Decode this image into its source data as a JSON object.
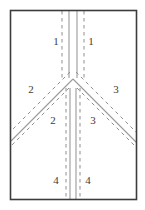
{
  "diagram": {
    "type": "lane-junction-schematic",
    "canvas": {
      "width": 145,
      "height": 210,
      "background": "#ffffff"
    },
    "frame": {
      "name": "outer-border",
      "x": 10.5,
      "y": 10.5,
      "width": 126,
      "height": 189,
      "stroke": "#3c3c3c",
      "stroke_width": 1.6,
      "fill": "none"
    },
    "colors": {
      "frame": "#3c3c3c",
      "solid_lane_line": "#9a9a9a",
      "dashed_lane_line": "#8f8f8f",
      "label_text": "#3b3b3b",
      "background": "#ffffff"
    },
    "geometry": {
      "apex_x": 73,
      "apex_y": 78,
      "top_y": 11,
      "bottom_y": 199,
      "left_x": 11,
      "right_x": 136,
      "center_left_x": 69,
      "center_right_x": 77,
      "dash_pattern": "3.5 3.5",
      "solid_width": 1.1,
      "dashed_width": 1.0
    },
    "lanes": [
      {
        "id": "north-left-solid",
        "kind": "solid",
        "role": "center-divider-left",
        "points": "69,11 69,78"
      },
      {
        "id": "north-right-solid",
        "kind": "solid",
        "role": "center-divider-right",
        "points": "77,11 77,78"
      },
      {
        "id": "north-left-dashed",
        "kind": "dashed",
        "role": "lane-edge",
        "points": "62,11 62,78"
      },
      {
        "id": "north-right-dashed",
        "kind": "dashed",
        "role": "lane-edge",
        "points": "84,11 84,78"
      },
      {
        "id": "branch-left-solid",
        "kind": "solid",
        "role": "branch-center-left",
        "points": "73,79 11,141"
      },
      {
        "id": "branch-right-solid",
        "kind": "solid",
        "role": "branch-center-right",
        "points": "73,79 136,142"
      },
      {
        "id": "branch-left-dashed-upper",
        "kind": "dashed",
        "role": "branch-edge",
        "points": "70,72 11,131"
      },
      {
        "id": "branch-left-dashed-lower",
        "kind": "dashed",
        "role": "branch-edge",
        "points": "69,88 11,146"
      },
      {
        "id": "branch-right-dashed-upper",
        "kind": "dashed",
        "role": "branch-edge",
        "points": "76,72 136,132"
      },
      {
        "id": "branch-right-dashed-lower",
        "kind": "dashed",
        "role": "branch-edge",
        "points": "77,88 136,147"
      },
      {
        "id": "south-left-solid",
        "kind": "solid",
        "role": "center-divider-left",
        "points": "70,88 70,199"
      },
      {
        "id": "south-right-solid",
        "kind": "solid",
        "role": "center-divider-right",
        "points": "76,88 76,199"
      },
      {
        "id": "south-left-dashed",
        "kind": "dashed",
        "role": "lane-edge",
        "points": "66,88 66,199"
      },
      {
        "id": "south-right-dashed",
        "kind": "dashed",
        "role": "lane-edge",
        "points": "80,88 80,199"
      }
    ],
    "labels": [
      {
        "id": "label-1-left",
        "text": "1",
        "x": 56,
        "y": 42
      },
      {
        "id": "label-1-right",
        "text": "1",
        "x": 91,
        "y": 42
      },
      {
        "id": "label-2-upper",
        "text": "2",
        "x": 31,
        "y": 90
      },
      {
        "id": "label-3-upper",
        "text": "3",
        "x": 116,
        "y": 90
      },
      {
        "id": "label-2-lower",
        "text": "2",
        "x": 53,
        "y": 121
      },
      {
        "id": "label-3-lower",
        "text": "3",
        "x": 93,
        "y": 121
      },
      {
        "id": "label-4-left",
        "text": "4",
        "x": 56,
        "y": 181
      },
      {
        "id": "label-4-right",
        "text": "4",
        "x": 88,
        "y": 181
      }
    ]
  }
}
